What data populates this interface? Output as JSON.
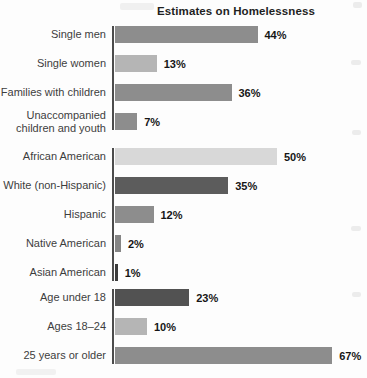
{
  "title": "Estimates on Homelessness",
  "chart_data": {
    "type": "bar",
    "orientation": "horizontal",
    "title": "Estimates on Homelessness",
    "unit": "%",
    "xlim": [
      0,
      70
    ],
    "grid": false,
    "legend": "none",
    "value_label_position": "end-of-bar",
    "axis_line_color": "#4c4c4c",
    "groups": [
      {
        "name": "household-type",
        "rows": [
          {
            "label": "Single men",
            "value": 44,
            "display": "44%",
            "color": "#8d8d8d"
          },
          {
            "label": "Single women",
            "value": 13,
            "display": "13%",
            "color": "#b5b5b5"
          },
          {
            "label": "Families with children",
            "value": 36,
            "display": "36%",
            "color": "#8d8d8d"
          },
          {
            "label": "Unaccompanied children and youth",
            "value": 7,
            "display": "7%",
            "color": "#8d8d8d"
          }
        ]
      },
      {
        "name": "race-ethnicity",
        "rows": [
          {
            "label": "African American",
            "value": 50,
            "display": "50%",
            "color": "#d8d8d8"
          },
          {
            "label": "White (non-Hispanic)",
            "value": 35,
            "display": "35%",
            "color": "#5c5c5c"
          },
          {
            "label": "Hispanic",
            "value": 12,
            "display": "12%",
            "color": "#8d8d8d"
          },
          {
            "label": "Native American",
            "value": 2,
            "display": "2%",
            "color": "#858585"
          },
          {
            "label": "Asian American",
            "value": 1,
            "display": "1%",
            "color": "#3c3c3c"
          }
        ]
      },
      {
        "name": "age-group",
        "rows": [
          {
            "label": "Age under 18",
            "value": 23,
            "display": "23%",
            "color": "#525252"
          },
          {
            "label": "Ages 18–24",
            "value": 10,
            "display": "10%",
            "color": "#b5b5b5"
          },
          {
            "label": "25 years or older",
            "value": 67,
            "display": "67%",
            "color": "#8d8d8d"
          }
        ]
      }
    ]
  }
}
